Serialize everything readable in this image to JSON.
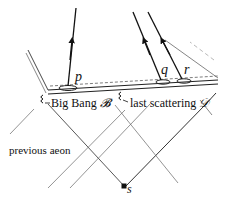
{
  "labels": {
    "big_bang": "Big Bang",
    "big_bang_symbol": "𝓑",
    "last_scattering": "last scattering",
    "last_scattering_symbol": "𝒟",
    "previous_aeon": "previous aeon",
    "point_p": "p",
    "point_q": "q",
    "point_r": "r",
    "point_s": "s"
  },
  "colors": {
    "ink": "#111111",
    "faint_line": "#777777",
    "background": "#ffffff"
  }
}
